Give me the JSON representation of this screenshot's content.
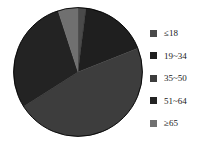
{
  "chart_data": {
    "type": "pie",
    "title": "",
    "subtitle": "",
    "xlabel": "",
    "ylabel": "",
    "legend_position": "right",
    "grid": false,
    "start_angle_deg": 0,
    "direction": "clockwise",
    "categories": [
      "≤18",
      "19~34",
      "35~50",
      "51~64",
      "≥65"
    ],
    "values": [
      2,
      17,
      47,
      29,
      5
    ],
    "units": "percent",
    "colors": [
      "#4a4a4a",
      "#1f1f1f",
      "#3d3d3d",
      "#232323",
      "#707070"
    ],
    "slices": [
      {
        "label": "≤18",
        "value": 2,
        "color": "#4a4a4a"
      },
      {
        "label": "19~34",
        "value": 17,
        "color": "#1f1f1f"
      },
      {
        "label": "35~50",
        "value": 47,
        "color": "#3d3d3d"
      },
      {
        "label": "51~64",
        "value": 29,
        "color": "#232323"
      },
      {
        "label": "≥65",
        "value": 5,
        "color": "#707070"
      }
    ]
  },
  "legend": {
    "items": [
      {
        "label": "≤18",
        "swatch_color": "#4a4a4a"
      },
      {
        "label": "19~34",
        "swatch_color": "#1f1f1f"
      },
      {
        "label": "35~50",
        "swatch_color": "#3d3d3d"
      },
      {
        "label": "51~64",
        "swatch_color": "#232323"
      },
      {
        "label": "≥65",
        "swatch_color": "#707070"
      }
    ]
  },
  "figure": {
    "background_color": "#ffffff",
    "outline_color": "#000000"
  }
}
